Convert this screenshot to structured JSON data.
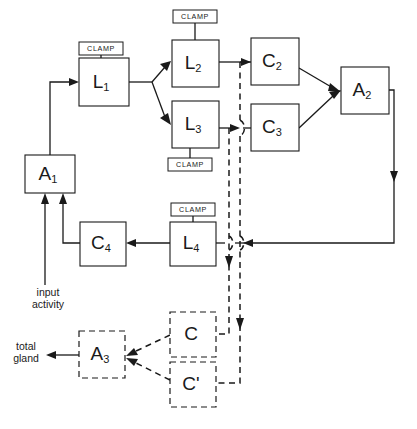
{
  "diagram": {
    "background_color": "#ffffff",
    "line_color": "#1a1a1a",
    "nodes": [
      {
        "id": "A1",
        "base": "A",
        "sub": "1",
        "style": "solid",
        "x": 25,
        "y": 155,
        "w": 50,
        "h": 38
      },
      {
        "id": "L1",
        "base": "L",
        "sub": "1",
        "style": "solid",
        "x": 79,
        "y": 58,
        "w": 50,
        "h": 48
      },
      {
        "id": "L2",
        "base": "L",
        "sub": "2",
        "style": "solid",
        "x": 172,
        "y": 40,
        "w": 47,
        "h": 47
      },
      {
        "id": "L3",
        "base": "L",
        "sub": "3",
        "style": "solid",
        "x": 172,
        "y": 101,
        "w": 47,
        "h": 47
      },
      {
        "id": "C2",
        "base": "C",
        "sub": "2",
        "style": "solid",
        "x": 251,
        "y": 38,
        "w": 48,
        "h": 47
      },
      {
        "id": "C3",
        "base": "C",
        "sub": "3",
        "style": "solid",
        "x": 251,
        "y": 104,
        "w": 48,
        "h": 47
      },
      {
        "id": "A2",
        "base": "A",
        "sub": "2",
        "style": "solid",
        "x": 341,
        "y": 67,
        "w": 48,
        "h": 47
      },
      {
        "id": "C4",
        "base": "C",
        "sub": "4",
        "style": "solid",
        "x": 80,
        "y": 222,
        "w": 46,
        "h": 44
      },
      {
        "id": "L4",
        "base": "L",
        "sub": "4",
        "style": "solid",
        "x": 170,
        "y": 222,
        "w": 46,
        "h": 44
      },
      {
        "id": "A3",
        "base": "A",
        "sub": "3",
        "style": "dashed",
        "x": 79,
        "y": 331,
        "w": 46,
        "h": 47
      },
      {
        "id": "C",
        "base": "C",
        "sub": "",
        "style": "dashed",
        "x": 170,
        "y": 312,
        "w": 46,
        "h": 45
      },
      {
        "id": "Cprime",
        "base": "C'",
        "sub": "",
        "style": "dashed",
        "x": 170,
        "y": 362,
        "w": 46,
        "h": 45
      }
    ],
    "clamps": [
      {
        "label": "CLAMP",
        "for": "L1",
        "x": 79,
        "y": 42,
        "w": 44,
        "h": 13
      },
      {
        "label": "CLAMP",
        "for": "L2",
        "x": 173,
        "y": 10,
        "w": 44,
        "h": 13
      },
      {
        "label": "CLAMP",
        "for": "L3",
        "x": 168,
        "y": 158,
        "w": 44,
        "h": 13
      },
      {
        "label": "CLAMP",
        "for": "L4",
        "x": 171,
        "y": 203,
        "w": 44,
        "h": 13
      }
    ],
    "edge_labels": [
      {
        "id": "input-activity",
        "lines": [
          "input",
          "activity"
        ],
        "x": 48,
        "y": 295
      },
      {
        "id": "total-gland",
        "lines": [
          "total",
          "gland"
        ],
        "x": 30,
        "y": 346
      }
    ]
  }
}
